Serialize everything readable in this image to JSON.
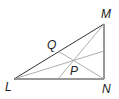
{
  "diagram": {
    "type": "triangle-with-cevians",
    "vertices": {
      "L": {
        "label": "L",
        "x": 14,
        "y": 79
      },
      "M": {
        "label": "M",
        "x": 104,
        "y": 24
      },
      "N": {
        "label": "N",
        "x": 104,
        "y": 79
      }
    },
    "points": {
      "Q": {
        "label": "Q",
        "x": 58,
        "y": 51
      },
      "P": {
        "label": "P",
        "x": 75,
        "y": 61
      }
    },
    "colors": {
      "triangle": "#333333",
      "cevian": "#999999",
      "text": "#222222"
    }
  }
}
